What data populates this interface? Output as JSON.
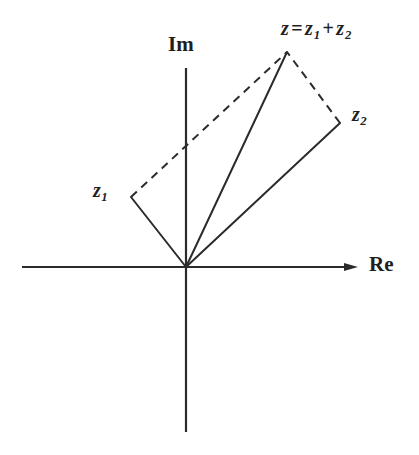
{
  "figure": {
    "kind": "complex-plane-vector-addition",
    "background_color": "#ffffff",
    "ink_color": "#2b2b2b"
  },
  "axes": {
    "real": {
      "label": "Re",
      "icon": "arrow-right-icon",
      "x_start": 22,
      "x_end": 358,
      "y": 267,
      "has_arrow": true
    },
    "imaginary": {
      "label": "Im",
      "x": 186,
      "y_start": 68,
      "y_end": 432,
      "has_arrow": false
    },
    "origin": {
      "x": 186,
      "y": 267
    }
  },
  "points": {
    "origin": {
      "name": "origin",
      "x": 186,
      "y": 267,
      "label": ""
    },
    "z1": {
      "name": "z1",
      "x": 131,
      "y": 197,
      "label_prefix": "z",
      "label_sub": "1"
    },
    "z2": {
      "name": "z2",
      "x": 340,
      "y": 123,
      "label_prefix": "z",
      "label_sub": "2"
    },
    "z": {
      "name": "z",
      "x": 287,
      "y": 52
    }
  },
  "labels": {
    "sum": {
      "lhs": "z",
      "equals": "=",
      "term1": "z",
      "term1_sub": "1",
      "plus": "+",
      "term2": "z",
      "term2_sub": "2",
      "full_text": "z = z1 + z2"
    }
  },
  "vectors": [
    {
      "name": "vector-z1",
      "from": "origin",
      "to": "z1",
      "style": "solid"
    },
    {
      "name": "vector-z",
      "from": "origin",
      "to": "z",
      "style": "solid"
    },
    {
      "name": "vector-z2",
      "from": "origin",
      "to": "z2",
      "style": "solid"
    }
  ],
  "construction_lines": [
    {
      "name": "dashed-z1-to-z",
      "from": "z1",
      "to": "z",
      "style": "dashed"
    },
    {
      "name": "dashed-z2-to-z",
      "from": "z2",
      "to": "z",
      "style": "dashed"
    }
  ]
}
